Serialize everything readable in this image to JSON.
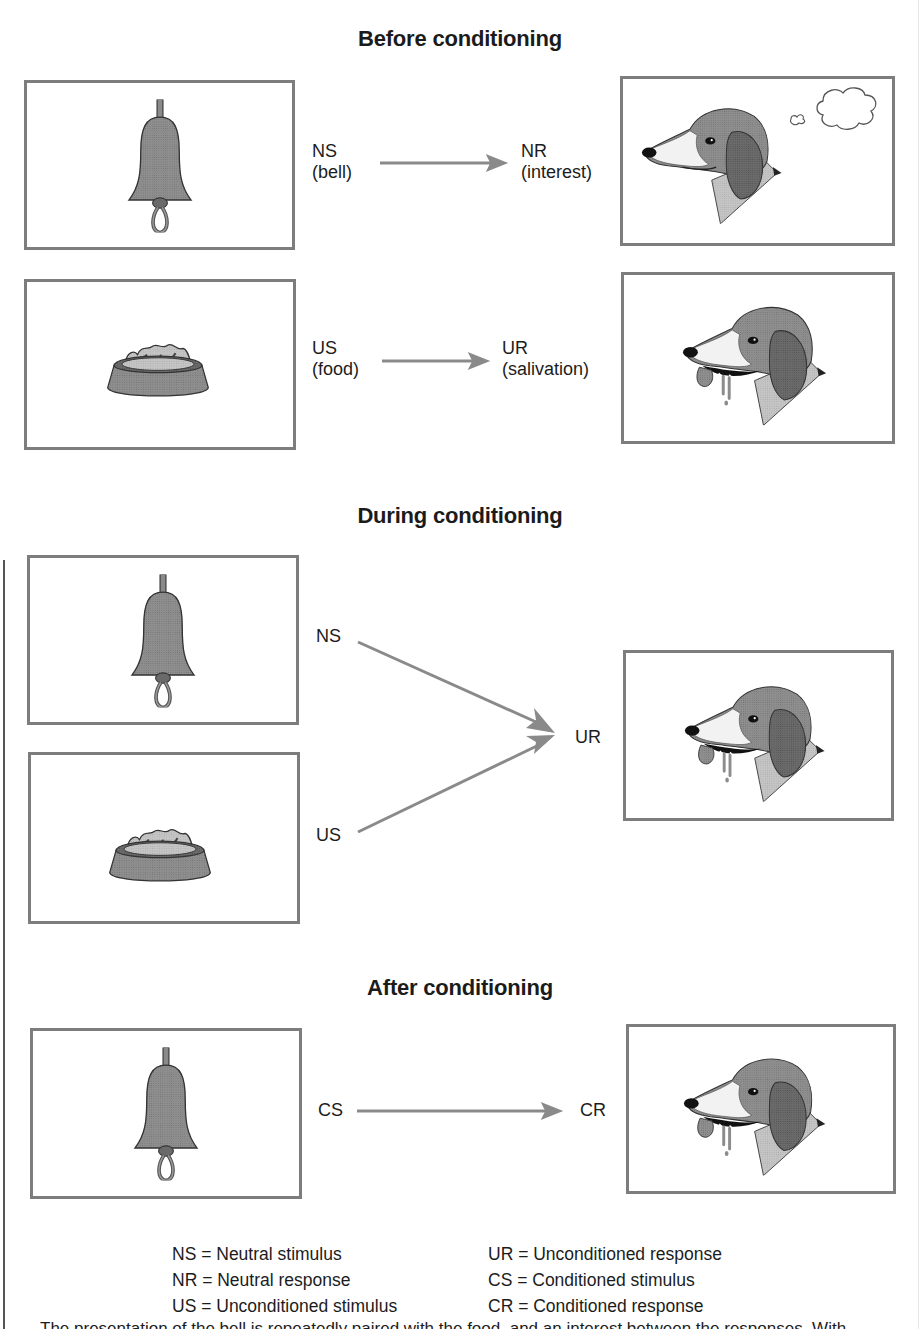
{
  "sections": {
    "before": {
      "title": "Before conditioning",
      "row1": {
        "stimulus_abbr": "NS",
        "stimulus_desc": "(bell)",
        "response_abbr": "NR",
        "response_desc": "(interest)"
      },
      "row2": {
        "stimulus_abbr": "US",
        "stimulus_desc": "(food)",
        "response_abbr": "UR",
        "response_desc": "(salivation)"
      }
    },
    "during": {
      "title": "During conditioning",
      "stimulus1_abbr": "NS",
      "stimulus2_abbr": "US",
      "response_abbr": "UR"
    },
    "after": {
      "title": "After conditioning",
      "stimulus_abbr": "CS",
      "response_abbr": "CR"
    }
  },
  "legend": {
    "left": [
      "NS = Neutral stimulus",
      "NR = Neutral response",
      "US = Unconditioned stimulus"
    ],
    "right": [
      "UR = Unconditioned response",
      "CS = Conditioned stimulus",
      "CR = Conditioned response"
    ]
  },
  "cut_off_text": "The presentation of the bell is repeatedly paired with the food, and an interest between the responses. With",
  "colors": {
    "box_border": "#7d7d7d",
    "arrow": "#8a8a8a",
    "illustration_gray": "#8c8c8c",
    "text": "#1c1c1c"
  },
  "icons": [
    "bell-icon",
    "food-bowl-icon",
    "dog-head-icon",
    "thought-bubble-icon",
    "arrow-right-icon"
  ]
}
